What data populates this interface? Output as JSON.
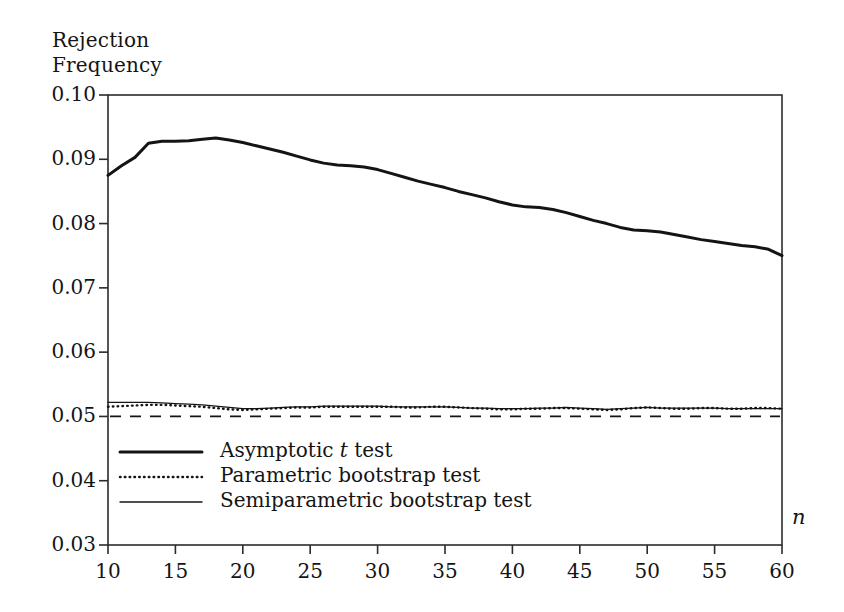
{
  "axes": {
    "y_axis_title_line1": "Rejection",
    "y_axis_title_line2": "Frequency",
    "x_axis_label": "n",
    "y_ticks": [
      "0.10",
      "0.09",
      "0.08",
      "0.07",
      "0.06",
      "0.05",
      "0.04",
      "0.03"
    ],
    "x_ticks": [
      "10",
      "15",
      "20",
      "25",
      "30",
      "35",
      "40",
      "45",
      "50",
      "55",
      "60"
    ]
  },
  "legend": {
    "items": [
      {
        "label_pre": "Asymptotic ",
        "label_em": "t",
        "label_post": " test",
        "style": "thick-solid"
      },
      {
        "label_pre": "Parametric bootstrap test",
        "label_em": "",
        "label_post": "",
        "style": "dotted"
      },
      {
        "label_pre": "Semiparametric bootstrap test",
        "label_em": "",
        "label_post": "",
        "style": "thin-solid"
      }
    ]
  },
  "colors": {
    "line": "#141414",
    "frame": "#2b2b2b",
    "background": "#ffffff"
  },
  "chart_data": {
    "type": "line",
    "title": "",
    "xlabel": "n",
    "ylabel": "Rejection Frequency",
    "xlim": [
      10,
      60
    ],
    "ylim": [
      0.03,
      0.1
    ],
    "grid": false,
    "legend_position": "inside-lower-left",
    "x": [
      10,
      11,
      12,
      13,
      14,
      15,
      16,
      17,
      18,
      19,
      20,
      21,
      22,
      23,
      24,
      25,
      26,
      27,
      28,
      29,
      30,
      31,
      32,
      33,
      34,
      35,
      36,
      37,
      38,
      39,
      40,
      41,
      42,
      43,
      44,
      45,
      46,
      47,
      48,
      49,
      50,
      51,
      52,
      53,
      54,
      55,
      56,
      57,
      58,
      59,
      60
    ],
    "series": [
      {
        "name": "Asymptotic t test",
        "style": "thick-solid",
        "values": [
          0.0875,
          0.089,
          0.0903,
          0.0925,
          0.0928,
          0.0928,
          0.0929,
          0.0931,
          0.0933,
          0.093,
          0.0926,
          0.0921,
          0.0916,
          0.0911,
          0.0905,
          0.0899,
          0.0894,
          0.0891,
          0.089,
          0.0888,
          0.0884,
          0.0878,
          0.0872,
          0.0866,
          0.0861,
          0.0856,
          0.085,
          0.0845,
          0.084,
          0.0834,
          0.0829,
          0.0826,
          0.0825,
          0.0822,
          0.0817,
          0.0811,
          0.0805,
          0.08,
          0.0794,
          0.079,
          0.0789,
          0.0787,
          0.0783,
          0.0779,
          0.0775,
          0.0772,
          0.0769,
          0.0766,
          0.0764,
          0.076,
          0.075
        ]
      },
      {
        "name": "Parametric bootstrap test",
        "style": "dotted",
        "values": [
          0.0515,
          0.0516,
          0.0517,
          0.0518,
          0.0518,
          0.0517,
          0.0516,
          0.0515,
          0.0513,
          0.0511,
          0.051,
          0.0511,
          0.0512,
          0.0513,
          0.0514,
          0.0514,
          0.0515,
          0.0515,
          0.0515,
          0.0515,
          0.0515,
          0.0515,
          0.0514,
          0.0514,
          0.0515,
          0.0515,
          0.0514,
          0.0513,
          0.0512,
          0.0511,
          0.0511,
          0.0512,
          0.0512,
          0.0513,
          0.0513,
          0.0512,
          0.0511,
          0.051,
          0.0511,
          0.0513,
          0.0514,
          0.0513,
          0.0512,
          0.0512,
          0.0513,
          0.0513,
          0.0512,
          0.0512,
          0.0513,
          0.0513,
          0.0512
        ]
      },
      {
        "name": "Semiparametric bootstrap test",
        "style": "thin-solid",
        "values": [
          0.0522,
          0.0522,
          0.0522,
          0.0522,
          0.0521,
          0.052,
          0.0519,
          0.0518,
          0.0516,
          0.0514,
          0.0512,
          0.0512,
          0.0513,
          0.0514,
          0.0515,
          0.0515,
          0.0516,
          0.0516,
          0.0516,
          0.0516,
          0.0516,
          0.0515,
          0.0515,
          0.0515,
          0.0515,
          0.0515,
          0.0514,
          0.0513,
          0.0513,
          0.0512,
          0.0512,
          0.0512,
          0.0513,
          0.0513,
          0.0514,
          0.0513,
          0.0512,
          0.0511,
          0.0512,
          0.0513,
          0.0514,
          0.0513,
          0.0513,
          0.0513,
          0.0513,
          0.0513,
          0.0512,
          0.0512,
          0.0512,
          0.0512,
          0.0512
        ]
      }
    ],
    "reference_line": {
      "name": "nominal level",
      "style": "dashed",
      "y": 0.05
    }
  }
}
